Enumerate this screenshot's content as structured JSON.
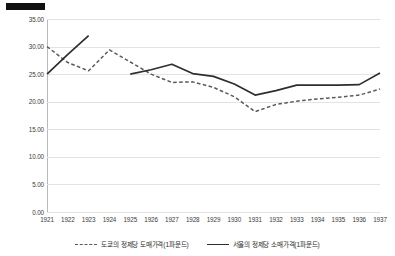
{
  "chart_data": {
    "type": "line",
    "title": "",
    "subtitle": "",
    "xlabel": "",
    "ylabel": "",
    "grid": true,
    "legend_position": "bottom",
    "ylim": [
      0.0,
      35.0
    ],
    "yticks": [
      "0.00",
      "5.00",
      "10.00",
      "15.00",
      "20.00",
      "25.00",
      "30.00",
      "35.00"
    ],
    "ytick_values": [
      0.0,
      5.0,
      10.0,
      15.0,
      20.0,
      25.0,
      30.0,
      35.0
    ],
    "categories": [
      "1921",
      "1922",
      "1923",
      "1924",
      "1925",
      "1926",
      "1927",
      "1928",
      "1929",
      "1930",
      "1931",
      "1932",
      "1933",
      "1934",
      "1935",
      "1936",
      "1937"
    ],
    "series": [
      {
        "name": "도쿄의 정제당 도매가격(1파운드)",
        "style": "dashed",
        "color": "#5a5a5a",
        "values": [
          30.0,
          27.1,
          25.6,
          29.4,
          27.2,
          25.0,
          23.5,
          23.6,
          22.6,
          20.9,
          18.2,
          19.5,
          20.1,
          20.5,
          20.8,
          21.2,
          22.3
        ]
      },
      {
        "name": "서울의 정제당 소매가격(1파운드)",
        "style": "solid",
        "color": "#2e2e2e",
        "values": [
          25.0,
          28.6,
          32.0,
          null,
          25.0,
          25.8,
          26.8,
          25.1,
          24.6,
          23.2,
          21.2,
          22.0,
          23.0,
          23.0,
          23.0,
          23.1,
          25.2
        ]
      }
    ]
  },
  "legend": {
    "entries": [
      {
        "label": "도쿄의 정제당 도매가격(1파운드)",
        "style": "dashed"
      },
      {
        "label": "서울의 정제당 소매가격(1파운드)",
        "style": "solid"
      }
    ]
  },
  "header_mark": {
    "name": "redaction-bar",
    "color": "#111111"
  }
}
